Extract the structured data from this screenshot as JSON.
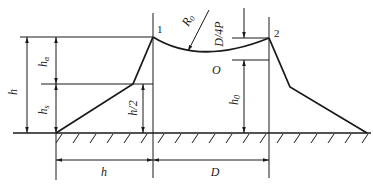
{
  "diagram": {
    "type": "dam-cross-section-profile",
    "points": {
      "point_1": "1",
      "point_2": "2",
      "center": "O"
    },
    "labels": {
      "h_total": "h",
      "h_alpha": "h",
      "h_alpha_sub": "α",
      "h_s": "h",
      "h_s_sub": "s",
      "h_half": "h/2",
      "h_0": "h",
      "h_0_sub": "0",
      "radius": "R",
      "radius_sub": "0",
      "d_over_4p": "D/4P",
      "bottom_h": "h",
      "bottom_d": "D"
    },
    "colors": {
      "line": "#1a1a1a",
      "background": "#ffffff"
    }
  }
}
